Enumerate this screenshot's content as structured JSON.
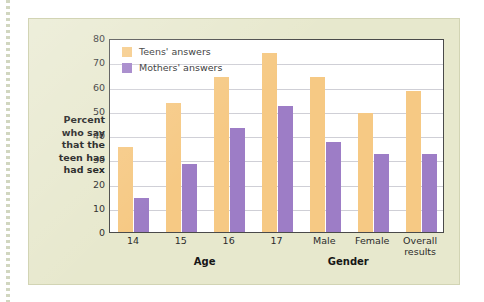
{
  "figure": {
    "plot_background": "#ffffff",
    "panel_background": "#e7e8cd",
    "teens_color": "#f6c984",
    "mothers_color": "#9d7dc6"
  },
  "y_axis_title_lines": [
    "Percent",
    "who say",
    "that the",
    "teen has",
    "had sex"
  ],
  "legend": {
    "items": [
      {
        "label": "Teens' answers",
        "color": "#f6c984",
        "key": "teens"
      },
      {
        "label": "Mothers' answers",
        "color": "#9d7dc6",
        "key": "mothers"
      }
    ]
  },
  "group_captions": [
    {
      "label": "Age",
      "center_index": 1.5
    },
    {
      "label": "Gender",
      "center_index": 4.5
    }
  ],
  "chart_data": {
    "type": "bar",
    "title": "",
    "xlabel": "",
    "ylabel": "Percent who say that the teen has had sex",
    "ylim": [
      0,
      80
    ],
    "ytick_step": 10,
    "yticks": [
      0,
      10,
      20,
      30,
      40,
      50,
      60,
      70,
      80
    ],
    "grid": true,
    "legend_position": "top-left inside plot",
    "categories": [
      "14",
      "15",
      "16",
      "17",
      "Male",
      "Female",
      "Overall results"
    ],
    "category_label_lines": [
      [
        "14"
      ],
      [
        "15"
      ],
      [
        "16"
      ],
      [
        "17"
      ],
      [
        "Male"
      ],
      [
        "Female"
      ],
      [
        "Overall",
        "results"
      ]
    ],
    "series": [
      {
        "name": "Teens' answers",
        "color": "#f6c984",
        "values": [
          35,
          53,
          64,
          74,
          64,
          49,
          58
        ]
      },
      {
        "name": "Mothers' answers",
        "color": "#9d7dc6",
        "values": [
          14,
          28,
          43,
          52,
          37,
          32,
          32
        ]
      }
    ]
  }
}
